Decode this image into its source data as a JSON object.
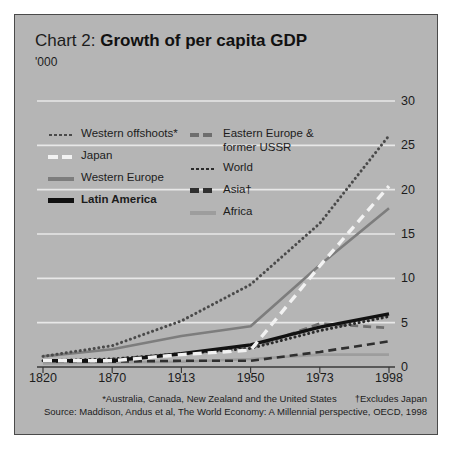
{
  "card": {
    "title_prefix": "Chart 2: ",
    "title_main": "Growth of per capita GDP",
    "units": "'000"
  },
  "legend": {
    "left": [
      {
        "label": "Western offshoots*",
        "style": "dotted-dark",
        "bold": false
      },
      {
        "label": "Japan",
        "style": "dashed-white",
        "bold": false
      },
      {
        "label": "Western Europe",
        "style": "solid-gray",
        "bold": false
      },
      {
        "label": "Latin America",
        "style": "solid-black",
        "bold": true
      }
    ],
    "right": [
      {
        "label": "Eastern Europe & former USSR",
        "style": "dashed-gray",
        "bold": false
      },
      {
        "label": "World",
        "style": "dotted-black",
        "bold": false
      },
      {
        "label": "Asia†",
        "style": "dashed-dark",
        "bold": false
      },
      {
        "label": "Africa",
        "style": "solid-light",
        "bold": false
      }
    ]
  },
  "footnotes": {
    "asterisk": "*Australia, Canada, New Zealand and the United States",
    "dagger": "†Excludes Japan",
    "source": "Source: Maddison, Andus et al, The World Economy: A Millennial perspective, OECD, 1998"
  },
  "chart_data": {
    "type": "line",
    "title": "Chart 2: Growth of per capita GDP",
    "subtitle": "'000",
    "xlabel": "",
    "ylabel": "'000",
    "categories": [
      "1820",
      "1870",
      "1913",
      "1950",
      "1973",
      "1998"
    ],
    "x_positions": [
      0,
      1,
      2,
      3,
      4,
      5
    ],
    "ylim": [
      0,
      30
    ],
    "yticks": [
      0,
      5,
      10,
      15,
      20,
      25,
      30
    ],
    "ytick_labels": [
      "0",
      "5",
      "10",
      "15",
      "20",
      "25",
      "30"
    ],
    "grid": "horizontal",
    "legend_position": "inside-top-left",
    "series": [
      {
        "name": "Western offshoots*",
        "style": "dotted",
        "color": "#4a4a4a",
        "values": [
          1.2,
          2.4,
          5.2,
          9.3,
          16.2,
          26.1
        ]
      },
      {
        "name": "Japan",
        "style": "dashed",
        "color": "#f2f2f2",
        "values": [
          0.7,
          0.7,
          1.4,
          1.9,
          11.4,
          20.4
        ]
      },
      {
        "name": "Western Europe",
        "style": "solid",
        "color": "#7d7d7d",
        "values": [
          1.2,
          2.0,
          3.5,
          4.6,
          11.5,
          17.9
        ]
      },
      {
        "name": "Latin America",
        "style": "solid",
        "color": "#111111",
        "values": [
          0.7,
          0.7,
          1.5,
          2.5,
          4.5,
          6.0
        ]
      },
      {
        "name": "Eastern Europe & former USSR",
        "style": "dashed",
        "color": "#6e6e6e",
        "values": [
          0.6,
          0.9,
          1.5,
          2.1,
          4.9,
          4.4
        ]
      },
      {
        "name": "World",
        "style": "dotted",
        "color": "#2b2b2b",
        "values": [
          0.7,
          0.9,
          1.5,
          2.1,
          4.1,
          5.7
        ]
      },
      {
        "name": "Asia†",
        "style": "dashed",
        "color": "#2f2f2f",
        "values": [
          0.6,
          0.6,
          0.7,
          0.7,
          1.7,
          2.9
        ]
      },
      {
        "name": "Africa",
        "style": "solid",
        "color": "#9d9d9d",
        "values": [
          0.4,
          0.5,
          0.6,
          0.9,
          1.4,
          1.4
        ]
      }
    ]
  }
}
